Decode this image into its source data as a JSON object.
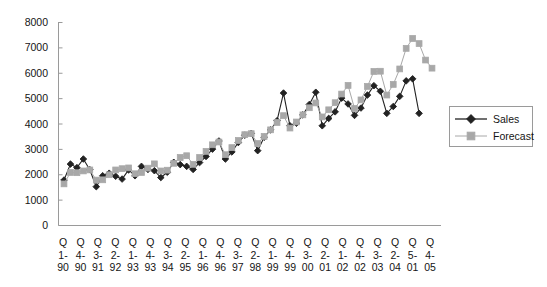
{
  "chart_data": {
    "type": "line",
    "title": "",
    "subtitle": "",
    "xlabel": "",
    "ylabel": "",
    "ylim": [
      0,
      8000
    ],
    "ytick_values": [
      0,
      1000,
      2000,
      3000,
      4000,
      5000,
      6000,
      7000,
      8000
    ],
    "ytick_labels": [
      "0",
      "1000",
      "2000",
      "3000",
      "4000",
      "5000",
      "6000",
      "7000",
      "8000"
    ],
    "grid": false,
    "legend_position": "right",
    "axis_color": "#9a9a9a",
    "xtick_labels": [
      {
        "q": "Q",
        "n": "1-",
        "y": "90"
      },
      {
        "q": "Q",
        "n": "4-",
        "y": "90"
      },
      {
        "q": "Q",
        "n": "3-",
        "y": "91"
      },
      {
        "q": "Q",
        "n": "2-",
        "y": "92"
      },
      {
        "q": "Q",
        "n": "1-",
        "y": "93"
      },
      {
        "q": "Q",
        "n": "4-",
        "y": "93"
      },
      {
        "q": "Q",
        "n": "3-",
        "y": "94"
      },
      {
        "q": "Q",
        "n": "2-",
        "y": "95"
      },
      {
        "q": "Q",
        "n": "1-",
        "y": "96"
      },
      {
        "q": "Q",
        "n": "4-",
        "y": "96"
      },
      {
        "q": "Q",
        "n": "3-",
        "y": "97"
      },
      {
        "q": "Q",
        "n": "2-",
        "y": "98"
      },
      {
        "q": "Q",
        "n": "1-",
        "y": "99"
      },
      {
        "q": "Q",
        "n": "4-",
        "y": "99"
      },
      {
        "q": "Q",
        "n": "3-",
        "y": "00"
      },
      {
        "q": "Q",
        "n": "2-",
        "y": "01"
      },
      {
        "q": "Q",
        "n": "1-",
        "y": "02"
      },
      {
        "q": "Q",
        "n": "4-",
        "y": "02"
      },
      {
        "q": "Q",
        "n": "3-",
        "y": "03"
      },
      {
        "q": "Q",
        "n": "2-",
        "y": "04"
      },
      {
        "q": "Q",
        "n": "5-",
        "y": "01"
      },
      {
        "q": "Q",
        "n": "4-",
        "y": "05"
      }
    ],
    "series": [
      {
        "name": "Sales",
        "color": "#222222",
        "marker": "diamond",
        "values": [
          1790,
          2420,
          2280,
          2620,
          2200,
          1530,
          1960,
          2060,
          1940,
          1830,
          2190,
          1960,
          2330,
          2210,
          2160,
          1890,
          2100,
          2490,
          2400,
          2330,
          2210,
          2480,
          2720,
          3010,
          3330,
          2620,
          2900,
          3270,
          3560,
          3630,
          2950,
          3480,
          3770,
          4130,
          5220,
          3930,
          4030,
          4360,
          4770,
          5250,
          3930,
          4220,
          4480,
          5020,
          4790,
          4340,
          4630,
          5140,
          5510,
          5290,
          4420,
          4690,
          5090,
          5700,
          5780,
          4420
        ]
      },
      {
        "name": "Forecast",
        "color": "#a8a8a8",
        "marker": "square",
        "values": [
          1640,
          2090,
          2080,
          2150,
          2190,
          1790,
          1800,
          2000,
          2190,
          2240,
          2270,
          2040,
          2090,
          2260,
          2430,
          2150,
          2180,
          2450,
          2680,
          2750,
          2410,
          2680,
          2920,
          3180,
          3290,
          2790,
          3070,
          3350,
          3580,
          3620,
          3230,
          3510,
          3770,
          4060,
          4330,
          3840,
          4080,
          4360,
          4640,
          4830,
          4280,
          4560,
          4840,
          5180,
          5520,
          4610,
          4950,
          5480,
          6070,
          6080,
          5140,
          5560,
          6170,
          6980,
          7370,
          7170,
          6520,
          6200
        ]
      }
    ]
  },
  "legend": {
    "items": [
      {
        "label": "Sales",
        "marker": "diamond-marker",
        "color": "#222222"
      },
      {
        "label": "Forecast",
        "marker": "square-marker",
        "color": "#a8a8a8"
      }
    ]
  }
}
